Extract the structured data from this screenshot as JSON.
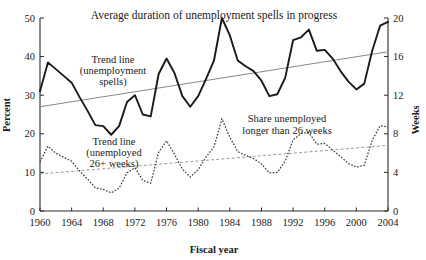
{
  "figure": {
    "title": "Average duration of unemployment spells in progress",
    "cropped_header": "",
    "xaxis_title": "Fiscal year",
    "yaxis_left_title": "Percent",
    "yaxis_right_title": "Weeks",
    "annotations": [
      {
        "id": "trend-spells",
        "lines": [
          "Trend line",
          "(unemployment",
          "spells)"
        ]
      },
      {
        "id": "trend-26weeks",
        "lines": [
          "Trend line",
          "(unemployed",
          "26+ weeks)"
        ]
      },
      {
        "id": "share-26weeks",
        "lines": [
          "Share unemployed",
          "longer than 26 weeks"
        ]
      }
    ]
  },
  "chart_data": {
    "type": "line",
    "title": "Average duration of unemployment spells in progress",
    "xlabel": "Fiscal year",
    "ylabel": "Percent",
    "ylabel_right": "Weeks",
    "xlim": [
      1960,
      2004
    ],
    "ylim": [
      0,
      50
    ],
    "ylim_right": [
      0,
      20
    ],
    "grid": false,
    "legend": "annotations-inline",
    "xticks": [
      1960,
      1964,
      1968,
      1972,
      1976,
      1980,
      1984,
      1988,
      1992,
      1996,
      2000,
      2004
    ],
    "yticks_left": [
      0,
      10,
      20,
      30,
      40,
      50
    ],
    "yticks_right": [
      0,
      4,
      8,
      12,
      16,
      20
    ],
    "x": [
      1960,
      1961,
      1962,
      1963,
      1964,
      1965,
      1966,
      1967,
      1968,
      1969,
      1970,
      1971,
      1972,
      1973,
      1974,
      1975,
      1976,
      1977,
      1978,
      1979,
      1980,
      1981,
      1982,
      1983,
      1984,
      1985,
      1986,
      1987,
      1988,
      1989,
      1990,
      1991,
      1992,
      1993,
      1994,
      1995,
      1996,
      1997,
      1998,
      1999,
      2000,
      2001,
      2002,
      2003,
      2004
    ],
    "series": [
      {
        "name": "Average duration of unemployment spells in progress",
        "axis": "right",
        "unit": "weeks",
        "style": "solid",
        "values": [
          12.4,
          15.4,
          14.7,
          14.0,
          13.3,
          11.8,
          10.4,
          8.9,
          8.8,
          7.9,
          8.8,
          11.3,
          12.0,
          10.0,
          9.8,
          14.2,
          15.8,
          14.3,
          11.9,
          10.8,
          11.9,
          13.7,
          15.6,
          20.0,
          18.2,
          15.6,
          15.0,
          14.5,
          13.5,
          11.9,
          12.1,
          13.8,
          17.7,
          18.0,
          18.8,
          16.6,
          16.7,
          15.8,
          14.5,
          13.4,
          12.6,
          13.2,
          16.6,
          19.2,
          19.6
        ]
      },
      {
        "name": "Share unemployed longer than 26 weeks",
        "axis": "left",
        "unit": "percent",
        "style": "dotted",
        "values": [
          12.7,
          16.8,
          15.0,
          13.9,
          12.9,
          10.4,
          8.3,
          6.0,
          5.6,
          4.7,
          5.9,
          9.9,
          11.2,
          7.9,
          7.2,
          15.2,
          18.2,
          14.7,
          10.9,
          8.8,
          10.7,
          14.0,
          16.6,
          23.9,
          19.1,
          15.4,
          14.4,
          13.6,
          12.2,
          9.9,
          10.0,
          12.9,
          18.4,
          20.1,
          20.3,
          17.3,
          17.5,
          15.8,
          14.1,
          12.3,
          11.4,
          11.8,
          18.3,
          22.1,
          21.8
        ]
      },
      {
        "name": "Trend line (unemployment spells)",
        "axis": "right",
        "unit": "weeks",
        "style": "trend-solid",
        "endpoints": [
          {
            "x": 1960,
            "y": 10.8
          },
          {
            "x": 2004,
            "y": 16.5
          }
        ]
      },
      {
        "name": "Trend line (unemployed 26+ weeks)",
        "axis": "left",
        "unit": "percent",
        "style": "trend-dotted",
        "endpoints": [
          {
            "x": 1960,
            "y": 9.6
          },
          {
            "x": 2004,
            "y": 17.0
          }
        ]
      }
    ]
  }
}
